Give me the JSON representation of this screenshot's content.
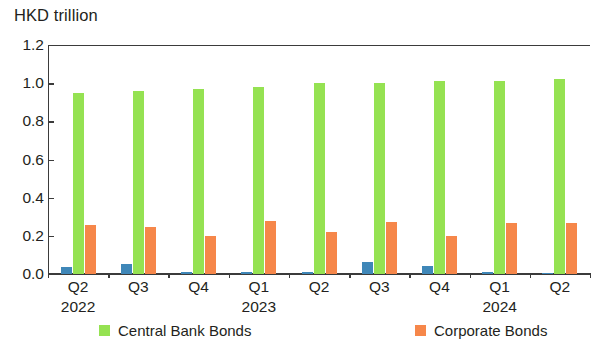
{
  "chart_data": {
    "type": "bar",
    "title": "HKD trillion",
    "xlabel": "",
    "ylabel": "HKD trillion",
    "ylim": [
      0.0,
      1.2
    ],
    "yticks": [
      "0.0",
      "0.2",
      "0.4",
      "0.6",
      "0.8",
      "1.0",
      "1.2"
    ],
    "ytick_values": [
      0.0,
      0.2,
      0.4,
      0.6,
      0.8,
      1.0,
      1.2
    ],
    "grid": false,
    "legend_position": "bottom",
    "categories": [
      "Q2",
      "Q3",
      "Q4",
      "Q1",
      "Q2",
      "Q3",
      "Q4",
      "Q1",
      "Q2"
    ],
    "year_labels": [
      {
        "index": 0,
        "text": "2022"
      },
      {
        "index": 3,
        "text": "2023"
      },
      {
        "index": 7,
        "text": "2024"
      }
    ],
    "series": [
      {
        "name": "Other",
        "color": "#3f87b8",
        "in_legend": false,
        "values": [
          0.035,
          0.055,
          0.008,
          0.008,
          0.01,
          0.065,
          0.04,
          0.008,
          0.005
        ]
      },
      {
        "name": "Central Bank Bonds",
        "color": "#95e252",
        "in_legend": true,
        "values": [
          0.95,
          0.96,
          0.97,
          0.98,
          1.0,
          1.0,
          1.01,
          1.01,
          1.02
        ]
      },
      {
        "name": "Corporate Bonds",
        "color": "#f6874a",
        "in_legend": true,
        "values": [
          0.255,
          0.245,
          0.2,
          0.28,
          0.22,
          0.27,
          0.2,
          0.265,
          0.265
        ]
      }
    ]
  },
  "legend": {
    "items": [
      {
        "label": "Central Bank Bonds",
        "color": "#95e252"
      },
      {
        "label": "Corporate Bonds",
        "color": "#f6874a"
      }
    ]
  }
}
